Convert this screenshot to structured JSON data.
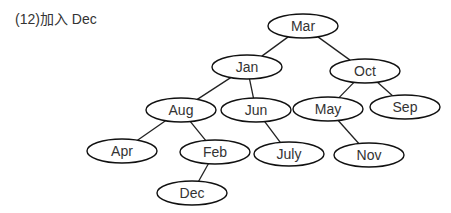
{
  "caption": "(12)加入 Dec",
  "tree": {
    "nodes": [
      {
        "id": "Mar",
        "label": "Mar",
        "cx": 303,
        "cy": 26
      },
      {
        "id": "Jan",
        "label": "Jan",
        "cx": 247,
        "cy": 67
      },
      {
        "id": "Oct",
        "label": "Oct",
        "cx": 365,
        "cy": 71
      },
      {
        "id": "Aug",
        "label": "Aug",
        "cx": 181,
        "cy": 110
      },
      {
        "id": "Jun",
        "label": "Jun",
        "cx": 256,
        "cy": 110
      },
      {
        "id": "May",
        "label": "May",
        "cx": 328,
        "cy": 109
      },
      {
        "id": "Sep",
        "label": "Sep",
        "cx": 405,
        "cy": 107
      },
      {
        "id": "Apr",
        "label": "Apr",
        "cx": 122,
        "cy": 151
      },
      {
        "id": "Feb",
        "label": "Feb",
        "cx": 215,
        "cy": 152
      },
      {
        "id": "July",
        "label": "July",
        "cx": 289,
        "cy": 154
      },
      {
        "id": "Nov",
        "label": "Nov",
        "cx": 369,
        "cy": 155
      },
      {
        "id": "Dec",
        "label": "Dec",
        "cx": 192,
        "cy": 193
      }
    ],
    "edges": [
      [
        "Mar",
        "Jan"
      ],
      [
        "Mar",
        "Oct"
      ],
      [
        "Jan",
        "Aug"
      ],
      [
        "Jan",
        "Jun"
      ],
      [
        "Oct",
        "May"
      ],
      [
        "Oct",
        "Sep"
      ],
      [
        "Aug",
        "Apr"
      ],
      [
        "Aug",
        "Feb"
      ],
      [
        "Jun",
        "July"
      ],
      [
        "May",
        "Nov"
      ],
      [
        "Feb",
        "Dec"
      ]
    ]
  }
}
